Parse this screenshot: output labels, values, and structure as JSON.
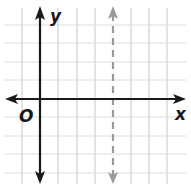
{
  "figure": {
    "type": "coordinate-plane",
    "axis_labels": {
      "x": "x",
      "y": "y",
      "origin": "O"
    },
    "grid": {
      "spacing_px": 18.3,
      "origin_px": [
        40,
        99
      ],
      "vertical_lines_px": [
        22,
        40,
        58,
        77,
        95,
        113,
        131,
        149,
        167
      ],
      "horizontal_lines_px": [
        25,
        43,
        62,
        80,
        99,
        117,
        136,
        154,
        173
      ]
    },
    "dashed_line": {
      "equation": "x = 4",
      "x_value": 4,
      "orientation": "vertical",
      "style": "dashed",
      "color": "#9a9a9a"
    },
    "colors": {
      "axis": "#1a1a1a",
      "grid": "#c8c8c8",
      "dashed": "#9a9a9a",
      "background": "#ffffff"
    }
  }
}
